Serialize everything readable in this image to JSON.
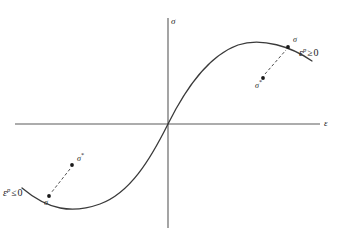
{
  "figure": {
    "name": "stress-strain-hardening-diagram",
    "background_color": "#ffffff",
    "stroke_color": "#3a3a3a",
    "text_color": "#1a1a1a"
  },
  "axes": {
    "vertical": {
      "label": "σ",
      "name": "stress-axis",
      "x": 168,
      "y_top": 18,
      "y_bottom": 228
    },
    "horizontal": {
      "label": "ε",
      "name": "strain-axis",
      "y": 124,
      "x_left": 15,
      "x_right": 320
    },
    "origin": {
      "x": 168,
      "y": 124
    }
  },
  "curve": {
    "name": "stress-strain-curve",
    "description": "S-shaped sigmoidal hardening curve through the origin",
    "path": "M 22 188 C 48 210, 72 214, 100 204 C 130 193, 150 160, 168 124 C 186 88, 208 56, 238 45 C 262 37, 292 47, 312 61"
  },
  "markers": [
    {
      "name": "sigma-point-upper",
      "label": "σ",
      "x": 288,
      "y": 47,
      "label_x": 293,
      "label_y": 36
    },
    {
      "name": "sigma-star-point-upper",
      "label": "σ",
      "star": "*",
      "x": 263,
      "y": 78,
      "label_x": 255,
      "label_y": 82
    },
    {
      "name": "sigma-point-lower",
      "label": "σ",
      "x": 49,
      "y": 196,
      "label_x": 44,
      "label_y": 199
    },
    {
      "name": "sigma-star-point-lower",
      "label": "σ",
      "star": "*",
      "x": 72,
      "y": 165,
      "label_x": 77,
      "label_y": 155
    }
  ],
  "connectors": [
    {
      "name": "dashed-connector-upper",
      "from_x": 265,
      "from_y": 74,
      "to_x": 286,
      "to_y": 50
    },
    {
      "name": "dashed-connector-lower",
      "from_x": 70,
      "from_y": 169,
      "to_x": 51,
      "to_y": 193
    }
  ],
  "conditions": [
    {
      "name": "plastic-strain-rate-nonnegative",
      "epsilon": "ε",
      "superscript": "p",
      "relation": "≥",
      "value": "0",
      "x": 299,
      "y": 48
    },
    {
      "name": "plastic-strain-rate-nonpositive",
      "epsilon": "ε",
      "superscript": "p",
      "relation": "≤",
      "value": "0",
      "x": 3,
      "y": 188
    }
  ]
}
